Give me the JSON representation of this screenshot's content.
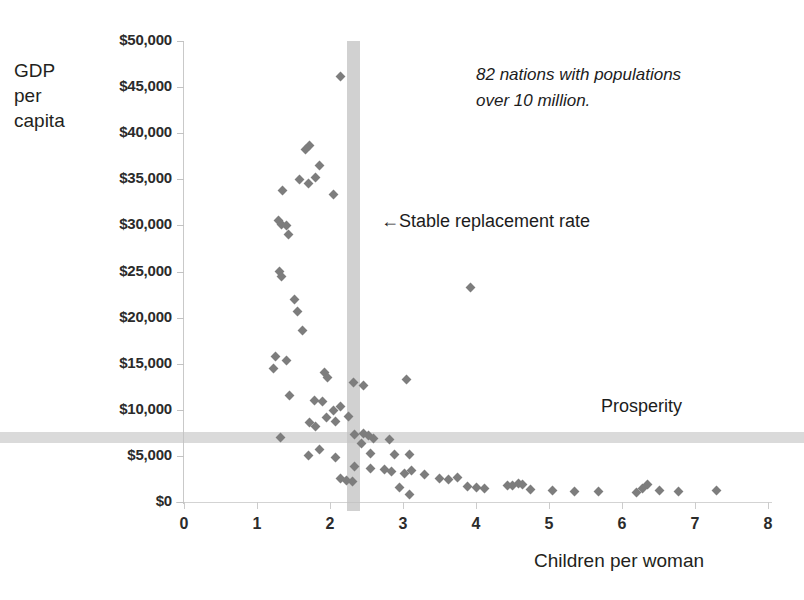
{
  "chart_data": {
    "type": "scatter",
    "title": "",
    "xlabel": "Children per woman",
    "ylabel": "GDP\nper\ncapita",
    "xlim": [
      0,
      8
    ],
    "ylim": [
      0,
      50000
    ],
    "xticks": [
      0,
      1,
      2,
      3,
      4,
      5,
      6,
      7,
      8
    ],
    "xticklabels": [
      "0",
      "1",
      "2",
      "3",
      "4",
      "5",
      "6",
      "7",
      "8"
    ],
    "yticks": [
      0,
      5000,
      10000,
      15000,
      20000,
      25000,
      30000,
      35000,
      40000,
      45000,
      50000
    ],
    "yticklabels": [
      "$0",
      "$5,000",
      "$10,000",
      "$15,000",
      "$20,000",
      "$25,000",
      "$30,000",
      "$35,000",
      "$40,000",
      "$45,000",
      "$50,000"
    ],
    "grid": false,
    "legend": null,
    "marker": "diamond",
    "marker_color": "#7d7d7d",
    "annotations": [
      {
        "name": "sample-note",
        "text": "82 nations with populations\nover 10 million.",
        "style": "italic",
        "x": 6.0,
        "y": 46000
      },
      {
        "name": "replacement-rate-label",
        "text": "←Stable replacement rate",
        "x": 2.7,
        "y": 30500
      },
      {
        "name": "prosperity-label",
        "text": "Prosperity",
        "x": 5.7,
        "y": 9200
      }
    ],
    "reference_lines": [
      {
        "name": "stable-replacement-rate",
        "orientation": "vertical",
        "value": 2.32,
        "color": "#bfbfbf",
        "width_units": 0.18
      },
      {
        "name": "prosperity-threshold",
        "orientation": "horizontal",
        "value": 7000,
        "color": "#c4c4c4"
      }
    ],
    "n_points": 82,
    "points": [
      [
        2.14,
        46200
      ],
      [
        1.72,
        38700
      ],
      [
        1.66,
        38200
      ],
      [
        1.86,
        36500
      ],
      [
        1.8,
        35200
      ],
      [
        1.58,
        35000
      ],
      [
        1.7,
        34500
      ],
      [
        1.35,
        33800
      ],
      [
        2.05,
        33400
      ],
      [
        1.29,
        30500
      ],
      [
        1.33,
        30100
      ],
      [
        1.4,
        30000
      ],
      [
        1.43,
        29000
      ],
      [
        1.31,
        25000
      ],
      [
        1.33,
        24500
      ],
      [
        1.52,
        22000
      ],
      [
        1.56,
        20700
      ],
      [
        1.62,
        18600
      ],
      [
        1.26,
        15800
      ],
      [
        1.4,
        15300
      ],
      [
        1.23,
        14500
      ],
      [
        1.92,
        14000
      ],
      [
        1.96,
        13500
      ],
      [
        2.32,
        13000
      ],
      [
        2.46,
        12600
      ],
      [
        3.05,
        13300
      ],
      [
        3.92,
        23300
      ],
      [
        1.44,
        11600
      ],
      [
        1.79,
        11000
      ],
      [
        1.9,
        10900
      ],
      [
        2.14,
        10400
      ],
      [
        2.05,
        9900
      ],
      [
        1.95,
        9200
      ],
      [
        2.08,
        8700
      ],
      [
        2.26,
        9300
      ],
      [
        1.72,
        8600
      ],
      [
        1.8,
        8200
      ],
      [
        1.32,
        7000
      ],
      [
        2.33,
        7300
      ],
      [
        2.46,
        7400
      ],
      [
        2.53,
        7200
      ],
      [
        2.6,
        6900
      ],
      [
        2.82,
        6800
      ],
      [
        2.43,
        6300
      ],
      [
        1.85,
        5700
      ],
      [
        1.7,
        5000
      ],
      [
        2.08,
        4800
      ],
      [
        2.55,
        5300
      ],
      [
        2.88,
        5200
      ],
      [
        3.09,
        5100
      ],
      [
        2.33,
        3800
      ],
      [
        2.56,
        3600
      ],
      [
        2.74,
        3500
      ],
      [
        2.84,
        3300
      ],
      [
        3.02,
        3100
      ],
      [
        3.12,
        3400
      ],
      [
        2.14,
        2600
      ],
      [
        2.22,
        2300
      ],
      [
        2.31,
        2200
      ],
      [
        3.3,
        3000
      ],
      [
        3.5,
        2600
      ],
      [
        2.95,
        1600
      ],
      [
        3.09,
        800
      ],
      [
        3.62,
        2400
      ],
      [
        3.74,
        2700
      ],
      [
        3.89,
        1700
      ],
      [
        4.0,
        1600
      ],
      [
        4.12,
        1500
      ],
      [
        4.43,
        1800
      ],
      [
        4.5,
        1750
      ],
      [
        4.58,
        2000
      ],
      [
        4.64,
        1900
      ],
      [
        4.75,
        1400
      ],
      [
        5.05,
        1200
      ],
      [
        5.35,
        1150
      ],
      [
        5.68,
        1100
      ],
      [
        6.2,
        1050
      ],
      [
        6.28,
        1450
      ],
      [
        6.35,
        1900
      ],
      [
        6.52,
        1200
      ],
      [
        6.78,
        1150
      ],
      [
        7.3,
        1250
      ]
    ]
  }
}
